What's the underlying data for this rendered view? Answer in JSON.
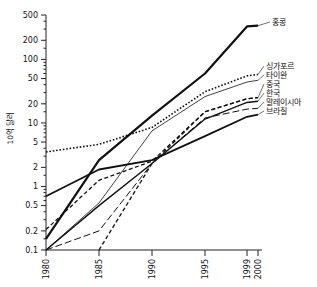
{
  "chart_data": {
    "type": "line",
    "title": "",
    "subtitle": "",
    "xlabel": "",
    "ylabel": "10억 달러",
    "xscale": "linear-year",
    "yscale": "log",
    "grid": false,
    "legend_position": "right-inline-labels",
    "x": [
      1980,
      1985,
      1990,
      1995,
      1999,
      2000
    ],
    "xtick_labels": [
      "1980",
      "1985",
      "1990",
      "1995",
      "1999",
      "2000"
    ],
    "ytick_labels": [
      "500",
      "200",
      "100",
      "50",
      "20",
      "10",
      "5",
      "2",
      "1",
      "0.5",
      "0.2",
      "0.1"
    ],
    "ytick_values": [
      500,
      200,
      100,
      50,
      20,
      10,
      5,
      2,
      1,
      0.5,
      0.2,
      0.1
    ],
    "ylim": [
      0.1,
      500
    ],
    "xlim": [
      1980,
      2000
    ],
    "series": [
      {
        "name": "홍콩",
        "label": "홍콩",
        "style": "thick-solid",
        "stroke_width": 2.2,
        "dasharray": "",
        "x": [
          1980,
          1985,
          1990,
          1995,
          1999,
          2000
        ],
        "values": [
          0.15,
          2.6,
          13,
          60,
          330,
          340
        ]
      },
      {
        "name": "싱가포르",
        "label": "싱가포르",
        "style": "dotted",
        "stroke_width": 1.6,
        "dasharray": "1.6 1.8",
        "x": [
          1980,
          1985,
          1990,
          1995,
          1999,
          2000
        ],
        "values": [
          3.5,
          4.6,
          8.5,
          31,
          55,
          58
        ]
      },
      {
        "name": "타이완",
        "label": "타이완",
        "style": "thin-solid",
        "stroke_width": 0.8,
        "dasharray": "",
        "x": [
          1980,
          1985,
          1990,
          1995,
          1999,
          2000
        ],
        "values": [
          0.1,
          0.55,
          7.5,
          26,
          44,
          47
        ]
      },
      {
        "name": "중국",
        "label": "중국",
        "style": "dashed",
        "stroke_width": 1.3,
        "dasharray": "4 2.5",
        "x": [
          1980,
          1985,
          1990,
          1995,
          1999,
          2000
        ],
        "values": [
          0.21,
          1.25,
          2.5,
          15,
          24,
          25
        ]
      },
      {
        "name": "한국",
        "label": "한국",
        "style": "solid",
        "stroke_width": 1.4,
        "dasharray": "",
        "x": [
          1980,
          1985,
          1990,
          1995,
          1999,
          2000
        ],
        "values": [
          0.1,
          0.5,
          2.3,
          11.5,
          21,
          22
        ]
      },
      {
        "name": "말레이시아",
        "label": "말레이시아",
        "style": "long-dash",
        "stroke_width": 1.0,
        "dasharray": "7 3",
        "x": [
          1980,
          1985,
          1990,
          1995,
          1999,
          2000
        ],
        "values": [
          0.1,
          0.2,
          2.3,
          12,
          16.5,
          17
        ]
      },
      {
        "name": "브라질",
        "label": "브라질",
        "style": "thick-solid-2",
        "stroke_width": 1.8,
        "dasharray": "",
        "x": [
          1980,
          1985,
          1990,
          1995,
          1999,
          2000
        ],
        "values": [
          0.7,
          1.85,
          2.6,
          6.2,
          12.5,
          13.5
        ]
      },
      {
        "name": "unlabeled-steep",
        "label": "",
        "style": "dashed-steep",
        "stroke_width": 1.3,
        "dasharray": "4 2.5",
        "x": [
          1985,
          1990,
          1995,
          1999,
          2000
        ],
        "values": [
          0.1,
          2.3,
          15,
          24,
          25
        ]
      }
    ]
  },
  "labels": {
    "y_axis_title": "10억 달러",
    "series_labels": [
      "홍콩",
      "싱가포르",
      "타이완",
      "중국",
      "한국",
      "말레이시아",
      "브라질"
    ]
  },
  "colors": {
    "ink": "#111111",
    "axis": "#222222",
    "background": "#ffffff"
  }
}
